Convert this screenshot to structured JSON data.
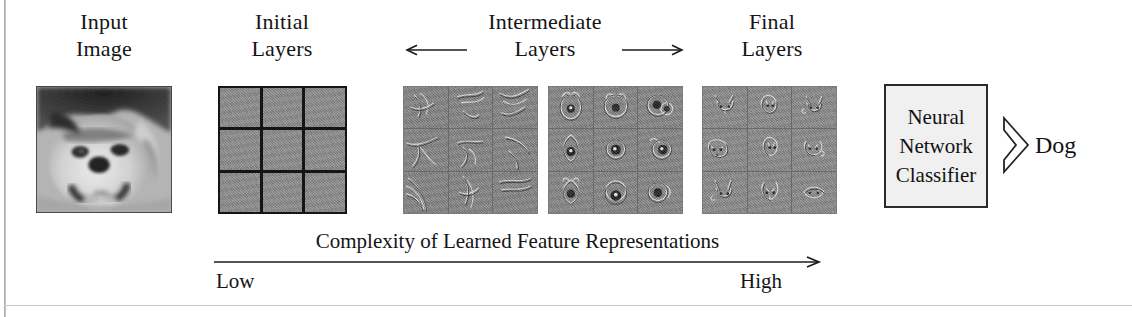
{
  "figure": {
    "columns": [
      {
        "name": "input-image",
        "line1": "Input",
        "line2": "Image"
      },
      {
        "name": "initial-layers",
        "line1": "Initial",
        "line2": "Layers"
      },
      {
        "name": "intermediate-layers",
        "line1": "Intermediate",
        "line2": "Layers"
      },
      {
        "name": "final-layers",
        "line1": "Final",
        "line2": "Layers"
      }
    ],
    "intermediate_arrows": {
      "left_icon": "arrow-left-icon",
      "right_icon": "arrow-right-icon"
    },
    "classifier": {
      "line1": "Neural",
      "line2": "Network",
      "line3": "Classifier",
      "output_arrow_icon": "chevron-right-icon",
      "output_label": "Dog"
    },
    "complexity_axis": {
      "caption": "Complexity of Learned Feature Representations",
      "low_label": "Low",
      "high_label": "High",
      "arrow_icon": "arrow-right-icon"
    },
    "colors": {
      "ink": "#18181a",
      "feature_gray": "#8a8a8a",
      "grid_line": "#151515",
      "classifier_fill": "#f0f0f0",
      "rule": "#c9c9c9"
    },
    "panels": {
      "input_image_alt": "grayscale photo of a small fluffy dog face",
      "grid_layout": "3x3"
    }
  }
}
